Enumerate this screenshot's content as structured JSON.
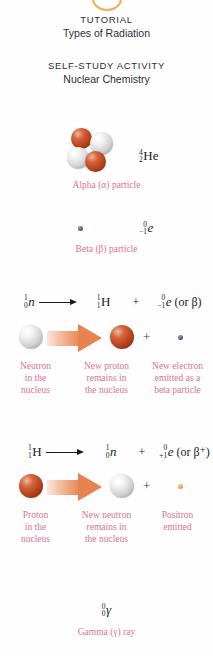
{
  "page": {
    "background_color": "#fefefe",
    "caption_color": "#d9738f",
    "text_color": "#1a1a1a",
    "arrow_color": "#e8834f"
  },
  "tutorial_header": {
    "kicker": "TUTORIAL",
    "title": "Types of Radiation"
  },
  "selfstudy_header": {
    "kicker": "SELF-STUDY ACTIVITY",
    "title": "Nuclear Chemistry"
  },
  "alpha": {
    "notation": {
      "mass_number": "4",
      "atomic_number": "2",
      "symbol": "He"
    },
    "caption": "Alpha (α) particle",
    "particles": [
      {
        "name": "proton",
        "color": "#b2401a"
      },
      {
        "name": "neutron",
        "color": "#cfcfcf"
      },
      {
        "name": "neutron",
        "color": "#cfcfcf"
      },
      {
        "name": "proton",
        "color": "#b2401a"
      }
    ]
  },
  "beta": {
    "notation": {
      "mass_number": "0",
      "atomic_number": "−1",
      "symbol": "e"
    },
    "caption": "Beta (β) particle",
    "dot_color": "#4a5a8c"
  },
  "neutron_decay": {
    "reactant": {
      "mass_number": "1",
      "atomic_number": "0",
      "symbol": "n"
    },
    "arrow": "⟶",
    "product_1": {
      "mass_number": "1",
      "atomic_number": "1",
      "symbol": "H"
    },
    "plus": "+",
    "product_2": {
      "mass_number": "0",
      "atomic_number": "−1",
      "symbol": "e"
    },
    "product_2_alt": "(or β)",
    "diagram": {
      "start_particle": "neutron",
      "end_particle": "proton",
      "plus": "+",
      "emitted_particle": "electron"
    },
    "captions": [
      "Neutron\nin the\nnucleus",
      "New proton\nremains in\nthe nucleus",
      "New electron\nemitted as a\nbeta particle"
    ]
  },
  "proton_decay": {
    "reactant": {
      "mass_number": "1",
      "atomic_number": "1",
      "symbol": "H"
    },
    "arrow": "⟶",
    "product_1": {
      "mass_number": "1",
      "atomic_number": "0",
      "symbol": "n"
    },
    "plus": "+",
    "product_2": {
      "mass_number": "0",
      "atomic_number": "+1",
      "symbol": "e"
    },
    "product_2_alt": "(or β⁺)",
    "diagram": {
      "start_particle": "proton",
      "end_particle": "neutron",
      "plus": "+",
      "emitted_particle": "positron"
    },
    "captions": [
      "Proton\nin the\nnucleus",
      "New neutron\nremains in\nthe nucleus",
      "Positron\nemitted"
    ]
  },
  "gamma": {
    "notation": {
      "mass_number": "0",
      "atomic_number": "0",
      "symbol": "γ"
    },
    "caption": "Gamma (γ) ray"
  }
}
